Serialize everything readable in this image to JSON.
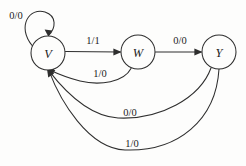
{
  "diagram": {
    "kind": "state-transition-diagram",
    "background_color": "#fdfdfc",
    "line_color": "#2e2e2e",
    "text_color": "#1c1c1c",
    "states": [
      {
        "id": "V",
        "label": "V",
        "cx": 48,
        "cy": 53,
        "r": 17
      },
      {
        "id": "W",
        "label": "W",
        "cx": 138,
        "cy": 52,
        "r": 17
      },
      {
        "id": "Y",
        "label": "Y",
        "cx": 219,
        "cy": 52,
        "r": 17
      }
    ],
    "transitions": [
      {
        "from": "V",
        "to": "V",
        "label": "0/0",
        "label_x": 16,
        "label_y": 15,
        "shape": "self-loop-top-left"
      },
      {
        "from": "V",
        "to": "W",
        "label": "1/1",
        "label_x": 93,
        "label_y": 40,
        "shape": "straight-right"
      },
      {
        "from": "W",
        "to": "Y",
        "label": "0/0",
        "label_x": 180,
        "label_y": 40,
        "shape": "straight-right"
      },
      {
        "from": "W",
        "to": "V",
        "label": "1/0",
        "label_x": 100,
        "label_y": 73,
        "shape": "curve-back-shallow"
      },
      {
        "from": "Y",
        "to": "V",
        "label": "0/0",
        "label_x": 130,
        "label_y": 112,
        "shape": "curve-back-medium"
      },
      {
        "from": "Y",
        "to": "V",
        "label": "1/0",
        "label_x": 132,
        "label_y": 143,
        "shape": "curve-back-deep"
      }
    ]
  }
}
